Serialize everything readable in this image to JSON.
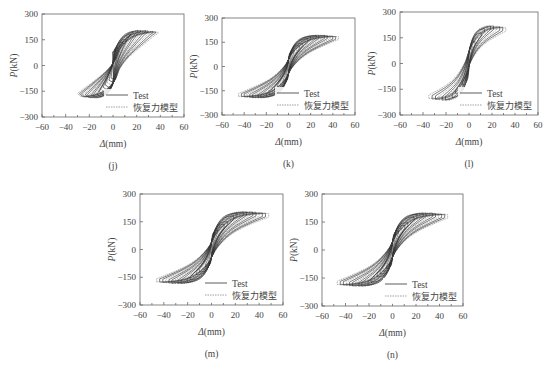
{
  "figure": {
    "panels": [
      "j",
      "k",
      "l",
      "m",
      "n"
    ]
  },
  "chart_data": [
    {
      "id": "j",
      "type": "line",
      "caption": "(j)",
      "xlabel": "Δ(mm)",
      "ylabel": "P(kN)",
      "xlim": [
        -60,
        60
      ],
      "ylim": [
        -300,
        300
      ],
      "xticks": [
        -60,
        -40,
        -20,
        0,
        20,
        40,
        60
      ],
      "yticks": [
        300,
        150,
        0,
        -150,
        -300
      ],
      "legend": [
        {
          "label": "Test",
          "style": "solid"
        },
        {
          "label": "恢复力模型",
          "style": "dotted"
        }
      ],
      "legend_position": "lower-right",
      "grid": false,
      "hysteresis": {
        "max_disp_pos": 38,
        "max_disp_neg": -30,
        "peak_load_pos": 200,
        "peak_load_neg": -185,
        "cycles": 18,
        "pinching": 0.2,
        "skew": 0.65
      }
    },
    {
      "id": "k",
      "type": "line",
      "caption": "(k)",
      "xlabel": "Δ(mm)",
      "ylabel": "P(kN)",
      "xlim": [
        -60,
        60
      ],
      "ylim": [
        -300,
        300
      ],
      "xticks": [
        -60,
        -40,
        -20,
        0,
        20,
        40,
        60
      ],
      "yticks": [
        300,
        150,
        0,
        -150,
        -300
      ],
      "legend": [
        {
          "label": "Test",
          "style": "solid"
        },
        {
          "label": "恢复力模型",
          "style": "dotted"
        }
      ],
      "legend_position": "lower-right",
      "grid": false,
      "hysteresis": {
        "max_disp_pos": 45,
        "max_disp_neg": -45,
        "peak_load_pos": 190,
        "peak_load_neg": -190,
        "cycles": 18,
        "pinching": 0.45,
        "skew": 0.0
      }
    },
    {
      "id": "l",
      "type": "line",
      "caption": "(l)",
      "xlabel": "Δ(mm)",
      "ylabel": "P(kN)",
      "xlim": [
        -60,
        60
      ],
      "ylim": [
        -300,
        300
      ],
      "xticks": [
        -60,
        -40,
        -20,
        0,
        20,
        40,
        60
      ],
      "yticks": [
        300,
        150,
        0,
        -150,
        -300
      ],
      "legend": [
        {
          "label": "Test",
          "style": "solid"
        },
        {
          "label": "恢复力模型",
          "style": "dotted"
        }
      ],
      "legend_position": "lower-right",
      "grid": false,
      "hysteresis": {
        "max_disp_pos": 32,
        "max_disp_neg": -35,
        "peak_load_pos": 215,
        "peak_load_neg": -210,
        "cycles": 12,
        "pinching": 0.55,
        "skew": 0.0
      }
    },
    {
      "id": "m",
      "type": "line",
      "caption": "(m)",
      "xlabel": "Δ(mm)",
      "ylabel": "P(kN)",
      "xlim": [
        -60,
        60
      ],
      "ylim": [
        -300,
        300
      ],
      "xticks": [
        -60,
        -40,
        -20,
        0,
        20,
        40,
        60
      ],
      "yticks": [
        300,
        150,
        0,
        -150,
        -300
      ],
      "legend": [
        {
          "label": "Test",
          "style": "solid"
        },
        {
          "label": "恢复力模型",
          "style": "dotted"
        }
      ],
      "legend_position": "lower-right",
      "grid": false,
      "hysteresis": {
        "max_disp_pos": 48,
        "max_disp_neg": -46,
        "peak_load_pos": 200,
        "peak_load_neg": -180,
        "cycles": 18,
        "pinching": 0.5,
        "skew": 0.0
      }
    },
    {
      "id": "n",
      "type": "line",
      "caption": "(n)",
      "xlabel": "Δ(mm)",
      "ylabel": "P(kN)",
      "xlim": [
        -60,
        60
      ],
      "ylim": [
        -300,
        300
      ],
      "xticks": [
        -60,
        -40,
        -20,
        0,
        20,
        40,
        60
      ],
      "yticks": [
        300,
        150,
        0,
        -150,
        -300
      ],
      "legend": [
        {
          "label": "Test",
          "style": "solid"
        },
        {
          "label": "恢复力模型",
          "style": "dotted"
        }
      ],
      "legend_position": "lower-right",
      "grid": false,
      "hysteresis": {
        "max_disp_pos": 47,
        "max_disp_neg": -47,
        "peak_load_pos": 195,
        "peak_load_neg": -190,
        "cycles": 18,
        "pinching": 0.5,
        "skew": 0.0
      }
    }
  ],
  "layout": {
    "frames": {
      "j": {
        "x": 42,
        "y": 14,
        "w": 142,
        "h": 103
      },
      "k": {
        "x": 222,
        "y": 18,
        "w": 133,
        "h": 97
      },
      "l": {
        "x": 400,
        "y": 12,
        "w": 138,
        "h": 103
      },
      "m": {
        "x": 140,
        "y": 194,
        "w": 143,
        "h": 111
      },
      "n": {
        "x": 322,
        "y": 194,
        "w": 141,
        "h": 112
      }
    }
  }
}
